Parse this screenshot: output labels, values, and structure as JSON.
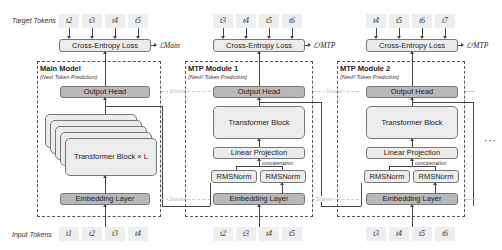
{
  "rows": {
    "target_label": "Target Tokens",
    "input_label": "Input Tokens"
  },
  "main": {
    "title": "Main Model",
    "subtitle": "(Next Token Prediction)",
    "loss_box": "Cross-Entropy Loss",
    "loss_symbol": "ℒMain",
    "output_head": "Output Head",
    "transformer": "Transformer Block × L",
    "embedding": "Embedding Layer",
    "target_tokens": [
      "t2",
      "t3",
      "t4",
      "t5"
    ],
    "input_tokens": [
      "t1",
      "t2",
      "t3",
      "t4"
    ]
  },
  "mtp1": {
    "title": "MTP Module 1",
    "subtitle": "(Next² Token Prediction)",
    "loss_box": "Cross-Entropy Loss",
    "loss_symbol": "ℒ¹MTP",
    "output_head": "Output Head",
    "transformer": "Transformer Block",
    "linear": "Linear Projection",
    "concat": "concatenation",
    "rmsnorm_a": "RMSNorm",
    "rmsnorm_b": "RMSNorm",
    "embedding": "Embedding Layer",
    "target_tokens": [
      "t3",
      "t4",
      "t5",
      "t6"
    ],
    "input_tokens": [
      "t2",
      "t3",
      "t4",
      "t5"
    ]
  },
  "mtp2": {
    "title": "MTP Module 2",
    "subtitle": "(Next³ Token Prediction)",
    "loss_box": "Cross-Entropy Loss",
    "loss_symbol": "ℒ²MTP",
    "output_head": "Output Head",
    "transformer": "Transformer Block",
    "linear": "Linear Projection",
    "concat": "concatenation",
    "rmsnorm_a": "RMSNorm",
    "rmsnorm_b": "RMSNorm",
    "embedding": "Embedding Layer",
    "target_tokens": [
      "t4",
      "t5",
      "t6",
      "t7"
    ],
    "input_tokens": [
      "t3",
      "t4",
      "t5",
      "t6"
    ]
  },
  "shared_label": "Shared",
  "ellipsis": "···"
}
